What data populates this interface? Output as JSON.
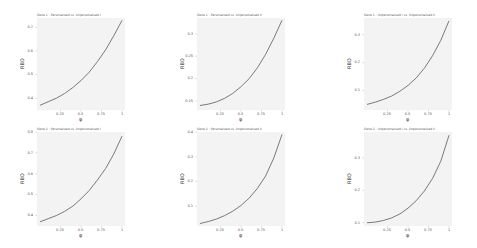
{
  "chart_data": [
    {
      "type": "line",
      "title": "Gene 1 : Personalised vs. Unpersonalised I",
      "xlabel": "φ",
      "ylabel": "RBO",
      "xlim": [
        0,
        1
      ],
      "ylim": [
        0.35,
        0.74
      ],
      "xticks": [
        "0.25",
        "0.5",
        "0.75",
        "1"
      ],
      "yticks": [
        "0.4",
        "0.5",
        "0.6",
        "0.7"
      ],
      "ytick_values": [
        0.4,
        0.5,
        0.6,
        0.7
      ],
      "x": [
        0,
        0.1,
        0.2,
        0.3,
        0.4,
        0.5,
        0.6,
        0.7,
        0.8,
        0.9,
        1.0
      ],
      "values": [
        0.37,
        0.385,
        0.4,
        0.42,
        0.445,
        0.475,
        0.51,
        0.555,
        0.605,
        0.665,
        0.73
      ],
      "grid": false,
      "background": "#f3f3f3"
    },
    {
      "type": "line",
      "title": "Gene 1 : Personalised vs. Unpersonalised II",
      "xlabel": "φ",
      "ylabel": "RBO",
      "xlim": [
        0,
        1
      ],
      "ylim": [
        0.13,
        0.335
      ],
      "xticks": [
        "0.25",
        "0.5",
        "0.75",
        "1"
      ],
      "yticks": [
        "0.15",
        "0.2",
        "0.25",
        "0.3"
      ],
      "ytick_values": [
        0.15,
        0.2,
        0.25,
        0.3
      ],
      "x": [
        0,
        0.1,
        0.2,
        0.3,
        0.4,
        0.5,
        0.6,
        0.7,
        0.8,
        0.9,
        1.0
      ],
      "values": [
        0.14,
        0.143,
        0.148,
        0.156,
        0.167,
        0.182,
        0.2,
        0.224,
        0.254,
        0.29,
        0.33
      ],
      "grid": false,
      "background": "#f3f3f3"
    },
    {
      "type": "line",
      "title": "Gene 1 : Unpersonalised I vs. Unpersonalised II",
      "xlabel": "φ",
      "ylabel": "RBO",
      "xlim": [
        0,
        1
      ],
      "ylim": [
        0.03,
        0.36
      ],
      "xticks": [
        "0.25",
        "0.5",
        "0.75",
        "1"
      ],
      "yticks": [
        "0.1",
        "0.2",
        "0.3"
      ],
      "ytick_values": [
        0.1,
        0.2,
        0.3
      ],
      "x": [
        0,
        0.1,
        0.2,
        0.3,
        0.4,
        0.5,
        0.6,
        0.7,
        0.8,
        0.9,
        1.0
      ],
      "values": [
        0.05,
        0.058,
        0.068,
        0.08,
        0.097,
        0.118,
        0.145,
        0.18,
        0.225,
        0.28,
        0.35
      ],
      "grid": false,
      "background": "#f3f3f3"
    },
    {
      "type": "line",
      "title": "Gene 2 : Personalised vs. Unpersonalised I",
      "xlabel": "φ",
      "ylabel": "RBO",
      "xlim": [
        0,
        1
      ],
      "ylim": [
        0.35,
        0.8
      ],
      "xticks": [
        "0.25",
        "0.5",
        "0.75",
        "1"
      ],
      "yticks": [
        "0.4",
        "0.5",
        "0.6",
        "0.7",
        "0.8"
      ],
      "ytick_values": [
        0.4,
        0.5,
        0.6,
        0.7,
        0.8
      ],
      "x": [
        0,
        0.1,
        0.2,
        0.3,
        0.4,
        0.5,
        0.6,
        0.7,
        0.8,
        0.9,
        1.0
      ],
      "values": [
        0.37,
        0.385,
        0.4,
        0.42,
        0.445,
        0.48,
        0.52,
        0.57,
        0.625,
        0.695,
        0.78
      ],
      "grid": false,
      "background": "#f3f3f3"
    },
    {
      "type": "line",
      "title": "Gene 2 : Personalised vs. Unpersonalised II",
      "xlabel": "φ",
      "ylabel": "RBO",
      "xlim": [
        0,
        1
      ],
      "ylim": [
        0.02,
        0.4
      ],
      "xticks": [
        "0.25",
        "0.5",
        "0.75",
        "1"
      ],
      "yticks": [
        "0.1",
        "0.2",
        "0.3",
        "0.4"
      ],
      "ytick_values": [
        0.1,
        0.2,
        0.3,
        0.4
      ],
      "x": [
        0,
        0.1,
        0.2,
        0.3,
        0.4,
        0.5,
        0.6,
        0.7,
        0.8,
        0.9,
        1.0
      ],
      "values": [
        0.03,
        0.038,
        0.048,
        0.062,
        0.08,
        0.103,
        0.133,
        0.172,
        0.222,
        0.295,
        0.39
      ],
      "grid": false,
      "background": "#f3f3f3"
    },
    {
      "type": "line",
      "title": "Gene 2 : Unpersonalised I vs. Unpersonalised II",
      "xlabel": "φ",
      "ylabel": "RBO",
      "xlim": [
        0,
        1
      ],
      "ylim": [
        0.09,
        0.38
      ],
      "xticks": [
        "0.25",
        "0.5",
        "0.75",
        "1"
      ],
      "yticks": [
        "0.1",
        "0.2",
        "0.3"
      ],
      "ytick_values": [
        0.1,
        0.2,
        0.3
      ],
      "x": [
        0,
        0.1,
        0.2,
        0.3,
        0.4,
        0.5,
        0.6,
        0.7,
        0.8,
        0.9,
        1.0
      ],
      "values": [
        0.1,
        0.102,
        0.107,
        0.115,
        0.127,
        0.145,
        0.168,
        0.198,
        0.237,
        0.29,
        0.37
      ],
      "grid": false,
      "background": "#f3f3f3"
    }
  ],
  "colors": {
    "line": "#5a5a5a",
    "panel_bg": "#f3f3f3",
    "text": "#444444"
  },
  "layout": {
    "panels": [
      {
        "left": 0,
        "top": 0,
        "plot": {
          "x": 37,
          "y": 18,
          "w": 88,
          "h": 92
        }
      },
      {
        "left": 159,
        "top": 0,
        "plot": {
          "x": 38,
          "y": 18,
          "w": 88,
          "h": 92
        }
      },
      {
        "left": 318,
        "top": 0,
        "plot": {
          "x": 46,
          "y": 18,
          "w": 88,
          "h": 92
        }
      },
      {
        "left": 0,
        "top": 124,
        "plot": {
          "x": 37,
          "y": 8,
          "w": 88,
          "h": 94
        }
      },
      {
        "left": 159,
        "top": 124,
        "plot": {
          "x": 38,
          "y": 8,
          "w": 88,
          "h": 94
        }
      },
      {
        "left": 318,
        "top": 124,
        "plot": {
          "x": 46,
          "y": 8,
          "w": 88,
          "h": 94
        }
      }
    ]
  }
}
